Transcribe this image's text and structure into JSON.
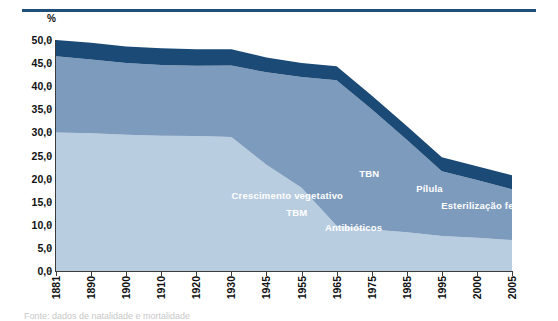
{
  "figure": {
    "unit_label": "%",
    "caption_fragment": "Fonte: dados de natalidade e mortalidade"
  },
  "chart_data": {
    "type": "area",
    "title": "",
    "xlabel": "",
    "ylabel": "%",
    "stacked": true,
    "grid": false,
    "legend_position": "in-chart",
    "ylim": [
      0,
      50
    ],
    "ytick_labels": [
      "0,0",
      "5,0",
      "10,0",
      "15,0",
      "20,0",
      "25,0",
      "30,0",
      "35,0",
      "40,0",
      "45,0",
      "50,0"
    ],
    "ytick_values": [
      0,
      5,
      10,
      15,
      20,
      25,
      30,
      35,
      40,
      45,
      50
    ],
    "categories": [
      "1881",
      "1890",
      "1900",
      "1910",
      "1920",
      "1930",
      "1945",
      "1955",
      "1965",
      "1975",
      "1985",
      "1995",
      "2000",
      "2005"
    ],
    "series": [
      {
        "name": "Taxa bruta de mortalidade (inferior)",
        "color": "#b9cde0",
        "labels": [
          "TBM",
          "Antibióticos"
        ],
        "values": [
          30.0,
          29.8,
          29.5,
          29.3,
          29.2,
          29.0,
          23.0,
          18.0,
          9.8,
          9.0,
          8.4,
          7.6,
          7.2,
          6.7
        ]
      },
      {
        "name": "Crescimento vegetativo (intermédio)",
        "color": "#7d9bbd",
        "labels": [
          "Crescimento vegetativo"
        ],
        "values": [
          16.5,
          16.0,
          15.5,
          15.3,
          15.2,
          15.5,
          20.0,
          24.0,
          31.5,
          26.0,
          20.0,
          14.0,
          12.5,
          11.0
        ]
      },
      {
        "name": "Taxa bruta de natalidade (superior)",
        "color": "#1a4a75",
        "labels": [
          "TBN",
          "Pílula",
          "Esterilização feminina"
        ],
        "values": [
          3.5,
          3.6,
          3.6,
          3.6,
          3.6,
          3.5,
          3.2,
          3.0,
          3.0,
          3.0,
          3.0,
          3.0,
          3.0,
          3.0
        ]
      }
    ],
    "stack_top_totals": [
      50.0,
      49.4,
      48.6,
      48.2,
      48.0,
      48.0,
      46.2,
      45.0,
      44.3,
      38.0,
      31.4,
      24.6,
      22.7,
      20.7
    ],
    "annotations": [
      {
        "text": "Crescimento vegetativo",
        "x_pct": 38.5,
        "y_pct": 32.5,
        "series": "middle"
      },
      {
        "text": "TBM",
        "x_pct": 50.5,
        "y_pct": 25.0,
        "series": "bottom"
      },
      {
        "text": "Antibióticos",
        "x_pct": 59.0,
        "y_pct": 18.5,
        "series": "bottom"
      },
      {
        "text": "TBN",
        "x_pct": 66.5,
        "y_pct": 42.0,
        "series": "top"
      },
      {
        "text": "Pílula",
        "x_pct": 79.0,
        "y_pct": 35.5,
        "series": "top"
      },
      {
        "text": "Esterilização feminina",
        "x_pct": 84.5,
        "y_pct": 28.0,
        "series": "top"
      }
    ]
  }
}
